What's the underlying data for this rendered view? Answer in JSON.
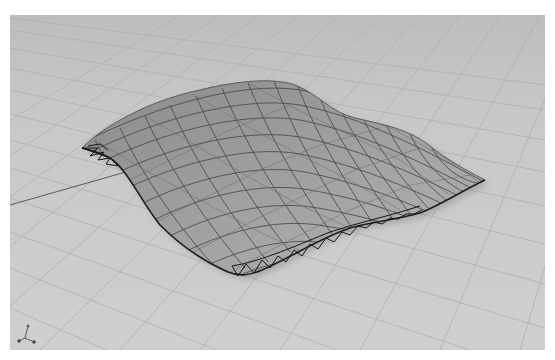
{
  "viewport": {
    "title": "",
    "view": "perspective",
    "background_color": "#c9c9c9",
    "grid_color": "#b4b4b4",
    "grid_major_color": "#6a6a6a",
    "object": {
      "name": "space-frame surface",
      "mesh_color": "#4a4a4a",
      "fill_color": "#8e8e8e",
      "edge_color": "#1e1e1e"
    },
    "axis_gizmo": {
      "labels": [
        "x",
        "y",
        "z"
      ]
    }
  }
}
